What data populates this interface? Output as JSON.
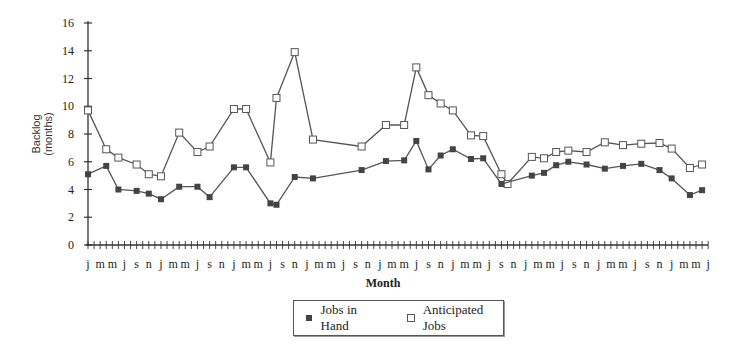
{
  "chart_data": {
    "type": "line",
    "title": "",
    "xlabel": "Month",
    "ylabel": "Backlog (months)",
    "ylabel_lines": [
      "Backlog",
      "(months)"
    ],
    "ylim": [
      0,
      16
    ],
    "yticks": [
      0,
      2,
      4,
      6,
      8,
      10,
      12,
      14,
      16
    ],
    "x_tick_label_pattern": [
      "j",
      "m",
      "m",
      "j",
      "s",
      "n"
    ],
    "x_tick_labels": [
      "j",
      "m",
      "m",
      "j",
      "s",
      "n",
      "j",
      "m",
      "m",
      "j",
      "s",
      "n",
      "j",
      "m",
      "m",
      "j",
      "s",
      "n",
      "j",
      "m",
      "m",
      "j",
      "s",
      "n",
      "j",
      "m",
      "m",
      "j",
      "s",
      "n",
      "j",
      "m",
      "m",
      "j",
      "s",
      "n",
      "j",
      "m",
      "m",
      "j",
      "s",
      "n",
      "j",
      "m",
      "m",
      "j",
      "s",
      "n",
      "j",
      "m",
      "m",
      "j"
    ],
    "x_months_total": 102,
    "grid": false,
    "legend_position": "bottom-center",
    "series": [
      {
        "name": "Jobs in Hand",
        "marker": "filled-square",
        "color": "#444444",
        "points": [
          [
            0,
            5.1
          ],
          [
            3,
            5.7
          ],
          [
            5,
            4.0
          ],
          [
            8,
            3.9
          ],
          [
            10,
            3.7
          ],
          [
            12,
            3.3
          ],
          [
            15,
            4.2
          ],
          [
            18,
            4.2
          ],
          [
            20,
            3.45
          ],
          [
            24,
            5.6
          ],
          [
            26,
            5.6
          ],
          [
            30,
            3.0
          ],
          [
            31,
            2.9
          ],
          [
            34,
            4.9
          ],
          [
            37,
            4.8
          ],
          [
            45,
            5.4
          ],
          [
            49,
            6.05
          ],
          [
            52,
            6.1
          ],
          [
            54,
            7.5
          ],
          [
            56,
            5.45
          ],
          [
            58,
            6.45
          ],
          [
            60,
            6.9
          ],
          [
            63,
            6.2
          ],
          [
            65,
            6.25
          ],
          [
            68,
            4.4
          ],
          [
            73,
            5.0
          ],
          [
            75,
            5.2
          ],
          [
            77,
            5.75
          ],
          [
            79,
            6.0
          ],
          [
            82,
            5.8
          ],
          [
            85,
            5.5
          ],
          [
            88,
            5.7
          ],
          [
            91,
            5.85
          ],
          [
            94,
            5.4
          ],
          [
            96,
            4.8
          ],
          [
            99,
            3.6
          ],
          [
            101,
            3.95
          ]
        ]
      },
      {
        "name": "Anticipated Jobs",
        "marker": "open-square",
        "color": "#555555",
        "points": [
          [
            0,
            9.7
          ],
          [
            3,
            6.9
          ],
          [
            5,
            6.3
          ],
          [
            8,
            5.8
          ],
          [
            10,
            5.1
          ],
          [
            12,
            4.95
          ],
          [
            15,
            8.1
          ],
          [
            18,
            6.7
          ],
          [
            20,
            7.1
          ],
          [
            24,
            9.8
          ],
          [
            26,
            9.8
          ],
          [
            30,
            5.95
          ],
          [
            31,
            10.6
          ],
          [
            34,
            13.9
          ],
          [
            37,
            7.6
          ],
          [
            45,
            7.1
          ],
          [
            49,
            8.65
          ],
          [
            52,
            8.65
          ],
          [
            54,
            12.8
          ],
          [
            56,
            10.8
          ],
          [
            58,
            10.2
          ],
          [
            60,
            9.7
          ],
          [
            63,
            7.9
          ],
          [
            65,
            7.85
          ],
          [
            68,
            5.1
          ],
          [
            69,
            4.4
          ],
          [
            73,
            6.35
          ],
          [
            75,
            6.25
          ],
          [
            77,
            6.7
          ],
          [
            79,
            6.8
          ],
          [
            82,
            6.7
          ],
          [
            85,
            7.4
          ],
          [
            88,
            7.2
          ],
          [
            91,
            7.3
          ],
          [
            94,
            7.35
          ],
          [
            96,
            6.95
          ],
          [
            99,
            5.55
          ],
          [
            101,
            5.8
          ]
        ]
      }
    ]
  },
  "legend": {
    "jobs_label": "Jobs in Hand",
    "anticipated_label": "Anticipated Jobs"
  },
  "axis": {
    "xlabel": "Month"
  }
}
